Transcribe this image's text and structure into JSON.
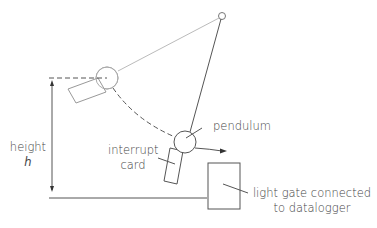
{
  "diagram": {
    "labels": {
      "pendulum": "pendulum",
      "interrupt_card_line1": "interrupt",
      "interrupt_card_line2": "card",
      "height_line1": "height",
      "height_line2": "h",
      "light_gate_line1": "light gate connected",
      "light_gate_line2": "to datalogger"
    },
    "colors": {
      "line": "#555555",
      "light_line": "#bbbbbb",
      "text": "#444444"
    }
  }
}
